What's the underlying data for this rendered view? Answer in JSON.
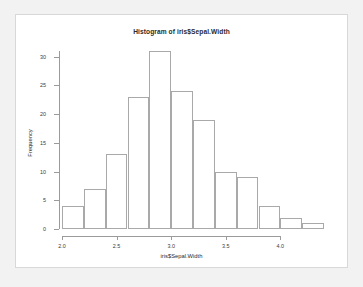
{
  "chart_data": {
    "type": "bar",
    "title": "Histogram of iris$Sepal.Width",
    "xlabel": "iris$Sepal.Width",
    "ylabel": "Frequency",
    "bin_width": 0.2,
    "bin_edges": [
      2.0,
      2.2,
      2.4,
      2.6,
      2.8,
      3.0,
      3.2,
      3.4,
      3.6,
      3.8,
      4.0,
      4.2,
      4.4
    ],
    "categories": [
      "2.0-2.2",
      "2.2-2.4",
      "2.4-2.6",
      "2.6-2.8",
      "2.8-3.0",
      "3.0-3.2",
      "3.2-3.4",
      "3.4-3.6",
      "3.6-3.8",
      "3.8-4.0",
      "4.0-4.2",
      "4.2-4.4"
    ],
    "values": [
      4,
      7,
      13,
      23,
      31,
      24,
      19,
      10,
      9,
      4,
      2,
      1
    ],
    "xlim": [
      2.0,
      4.4
    ],
    "ylim": [
      0,
      31
    ],
    "x_ticks": [
      2.0,
      2.5,
      3.0,
      3.5,
      4.0
    ],
    "x_tick_labels": [
      "2.0",
      "2.5",
      "3.0",
      "3.5",
      "4.0"
    ],
    "y_ticks": [
      0,
      5,
      10,
      15,
      20,
      25,
      30
    ],
    "y_tick_labels": [
      "0",
      "5",
      "10",
      "15",
      "20",
      "25",
      "30"
    ],
    "grid": false,
    "legend": false,
    "bar_fill_color": "#ffffff",
    "bar_border_color": "#a9a9a9",
    "axis_color": "#9b9b9b",
    "background_color": "#ffffff",
    "page_background_color": "#f2f2f2"
  }
}
